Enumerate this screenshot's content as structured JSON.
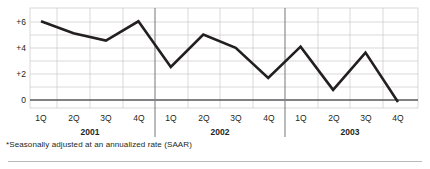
{
  "chart_data": {
    "type": "line",
    "title": "",
    "subtitle": "",
    "xlabel": "",
    "ylabel": "",
    "categories": [
      "1Q",
      "2Q",
      "3Q",
      "4Q",
      "1Q",
      "2Q",
      "3Q",
      "4Q",
      "1Q",
      "2Q",
      "3Q",
      "4Q"
    ],
    "groups": [
      {
        "label": "2001",
        "start_index": 0,
        "end_index": 3
      },
      {
        "label": "2002",
        "start_index": 4,
        "end_index": 7
      },
      {
        "label": "2003",
        "start_index": 8,
        "end_index": 11
      }
    ],
    "values": [
      6.0,
      5.0,
      4.4,
      6.0,
      2.2,
      4.9,
      3.8,
      1.3,
      3.9,
      0.3,
      3.4,
      -0.7
    ],
    "ytick_labels": [
      "+6",
      "+4",
      "+2",
      "0"
    ],
    "ytick_values": [
      6,
      4,
      2,
      0
    ],
    "ylim": [
      -1.2,
      7.1
    ],
    "grid": true,
    "legend": "none",
    "series_color": "#231f20",
    "grid_color": "#c8c8c8",
    "zero_line_color": "#58595b",
    "separator_color": "#808285",
    "footnote": "*Seasonally adjusted at an annualized rate (SAAR)"
  }
}
